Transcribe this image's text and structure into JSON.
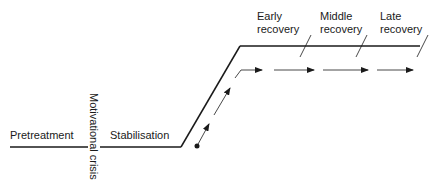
{
  "diagram": {
    "type": "stage-timeline",
    "stages": [
      {
        "id": "pretreatment",
        "label": "Pretreatment"
      },
      {
        "id": "motivational-crisis",
        "label": "Motivational crisis"
      },
      {
        "id": "stabilisation",
        "label": "Stabilisation"
      },
      {
        "id": "early-recovery",
        "label_line1": "Early",
        "label_line2": "recovery"
      },
      {
        "id": "middle-recovery",
        "label_line1": "Middle",
        "label_line2": "recovery"
      },
      {
        "id": "late-recovery",
        "label_line1": "Late",
        "label_line2": "recovery"
      }
    ],
    "colors": {
      "line": "#1a1a1a",
      "background": "#ffffff"
    }
  }
}
